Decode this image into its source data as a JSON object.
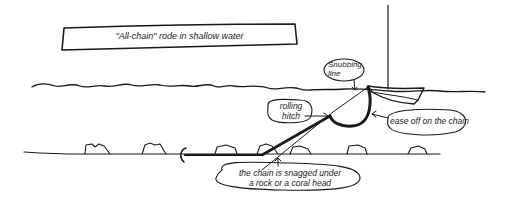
{
  "title": "\"All-chain\" rode in shallow water",
  "labels": {
    "snubbing_line_1": "Snubbing",
    "snubbing_line_2": "line",
    "rolling_hitch_1": "rolling",
    "rolling_hitch_2": "hitch",
    "ease_off": "ease off on the chain",
    "snagged_1": "the chain is snagged under",
    "snagged_2": "a rock or a coral head"
  },
  "colors": {
    "ink": "#1a1a1a",
    "background": "#ffffff"
  }
}
